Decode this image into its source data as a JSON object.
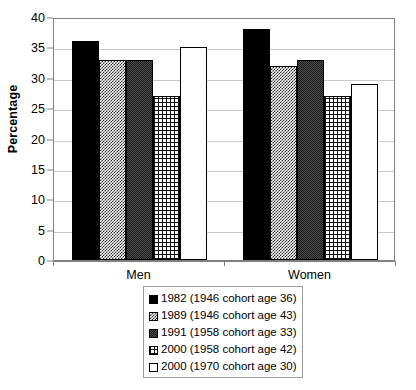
{
  "chart_data": {
    "type": "bar",
    "title": "",
    "subtitle": "",
    "xlabel": "",
    "ylabel": "Percentage",
    "ylim": [
      0,
      40
    ],
    "ytick_step": 5,
    "yticks": [
      0,
      5,
      10,
      15,
      20,
      25,
      30,
      35,
      40
    ],
    "categories": [
      "Men",
      "Women"
    ],
    "grid": true,
    "legend_position": "bottom",
    "series": [
      {
        "name": "1982 (1946 cohort age 36)",
        "values": [
          36,
          38
        ],
        "fill": "solid-black",
        "color": "#000000"
      },
      {
        "name": "1989 (1946 cohort age 43)",
        "values": [
          33,
          32
        ],
        "fill": "checker",
        "color": "#6e6e6e"
      },
      {
        "name": "1991 (1958 cohort age 33)",
        "values": [
          33,
          33
        ],
        "fill": "dark-gray",
        "color": "#3d3d3d"
      },
      {
        "name": "2000 (1958 cohort age 42)",
        "values": [
          27,
          27
        ],
        "fill": "grid",
        "color": "#555555"
      },
      {
        "name": "2000 (1970 cohort age 30)",
        "values": [
          35,
          29
        ],
        "fill": "white",
        "color": "#ffffff"
      }
    ]
  },
  "axis": {
    "y_title": "Percentage",
    "tick_labels": [
      "40",
      "35",
      "30",
      "25",
      "20",
      "15",
      "10",
      "5",
      "0"
    ],
    "category_labels": [
      "Men",
      "Women"
    ]
  },
  "legend": {
    "items": [
      {
        "label": "1982 (1946 cohort age 36)"
      },
      {
        "label": "1989 (1946 cohort age 43)"
      },
      {
        "label": "1991 (1958 cohort age 33)"
      },
      {
        "label": "2000 (1958 cohort age 42)"
      },
      {
        "label": "2000 (1970 cohort age 30)"
      }
    ]
  }
}
